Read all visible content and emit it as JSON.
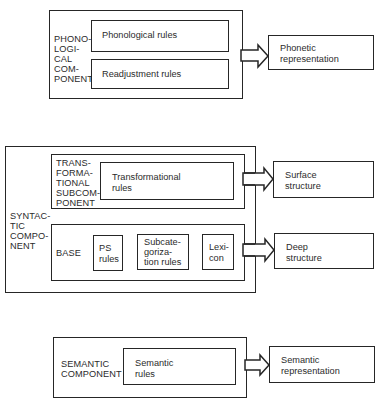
{
  "phonological": {
    "component_label": "PHONO-\nLOGI-\nCAL\nCOM-\nPONENT",
    "rules": [
      "Phonological rules",
      "Readjustment rules"
    ],
    "output": "Phonetic\nrepresentation"
  },
  "syntactic": {
    "component_label": "SYNTAC-\nTIC\nCOMPO-\nNENT",
    "transformational": {
      "label": "TRANS-\nFORMA-\nTIONAL\nSUBCOM-\nPONENT",
      "rules": "Transformational\nrules",
      "output": "Surface\nstructure"
    },
    "base": {
      "label": "BASE",
      "parts": [
        "PS\nrules",
        "Subcate-\ngoriza-\ntion rules",
        "Lexi-\ncon"
      ],
      "output": "Deep\nstructure"
    }
  },
  "semantic": {
    "component_label": "SEMANTIC\nCOMPONENT",
    "rules": "Semantic\nrules",
    "output": "Semantic\nrepresentation"
  }
}
